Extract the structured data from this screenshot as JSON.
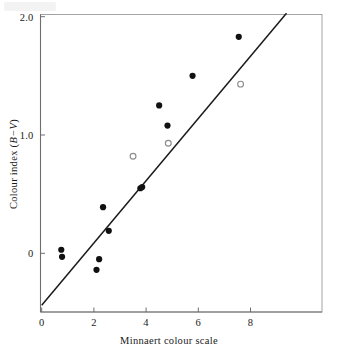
{
  "figure": {
    "background_color": "#ffffff",
    "ink_color": "#1a1a1a",
    "frame_color": "#9a9a9a",
    "marker_filled_color": "#111111",
    "marker_open_color": "#8c8c8c",
    "fit_line_color": "#1a1a1a"
  },
  "chart_data": {
    "type": "scatter",
    "title": "",
    "xlabel": "Minnaert colour scale",
    "ylabel": "Colour index (B−V)",
    "ylabel_parts": {
      "prefix": "Colour index (",
      "italic": "B−V",
      "suffix": ")"
    },
    "xlim": [
      -0.1,
      10.8
    ],
    "ylim": [
      -0.5,
      2.15
    ],
    "xticks": [
      0,
      2,
      4,
      6,
      8
    ],
    "xticklabels": [
      "0",
      "2",
      "4",
      "6",
      "8"
    ],
    "yticks": [
      0,
      1.0,
      2.0
    ],
    "yticklabels": [
      "0",
      "1.0",
      "2.0"
    ],
    "grid": false,
    "legend": "none",
    "series": [
      {
        "name": "filled",
        "marker": "filled-circle",
        "points": [
          {
            "x": 0.75,
            "y": 0.03
          },
          {
            "x": 0.78,
            "y": -0.03
          },
          {
            "x": 2.1,
            "y": -0.14
          },
          {
            "x": 2.2,
            "y": -0.05
          },
          {
            "x": 2.35,
            "y": 0.39
          },
          {
            "x": 2.57,
            "y": 0.19
          },
          {
            "x": 3.78,
            "y": 0.55
          },
          {
            "x": 3.85,
            "y": 0.56
          },
          {
            "x": 4.5,
            "y": 1.25
          },
          {
            "x": 4.82,
            "y": 1.08
          },
          {
            "x": 5.78,
            "y": 1.5
          },
          {
            "x": 7.55,
            "y": 1.83
          }
        ]
      },
      {
        "name": "open",
        "marker": "open-circle",
        "points": [
          {
            "x": 3.5,
            "y": 0.82
          },
          {
            "x": 4.85,
            "y": 0.93
          },
          {
            "x": 7.62,
            "y": 1.43
          }
        ]
      }
    ],
    "fit_line": {
      "name": "regression-line",
      "x1": 0.0,
      "y1": -0.44,
      "x2": 9.38,
      "y2": 2.03
    }
  },
  "axes": {
    "x_axis_name": "x-axis",
    "y_axis_name": "y-axis"
  }
}
